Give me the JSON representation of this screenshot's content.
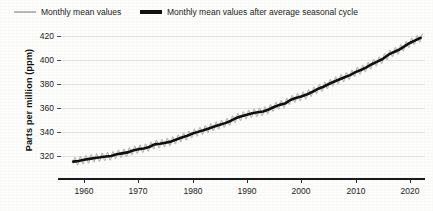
{
  "legend": {
    "items": [
      {
        "label": "Monthly mean values",
        "style": "thin-gray",
        "color": "#b9b9b9"
      },
      {
        "label": "Monthly mean values after average seasonal cycle",
        "style": "thick-black",
        "color": "#111111"
      }
    ]
  },
  "axes": {
    "ylabel": "Parts per million (ppm)",
    "yticks": [
      "320",
      "340",
      "360",
      "380",
      "400",
      "420"
    ],
    "xticks": [
      "1960",
      "1970",
      "1980",
      "1990",
      "2000",
      "2010",
      "2020"
    ]
  },
  "chart_data": {
    "type": "line",
    "title": "",
    "xlabel": "",
    "ylabel": "Parts per million (ppm)",
    "xlim": [
      1957,
      2024
    ],
    "ylim": [
      312,
      424
    ],
    "grid": true,
    "legend_position": "top-left",
    "x": [
      1958,
      1959,
      1960,
      1961,
      1962,
      1963,
      1964,
      1965,
      1966,
      1967,
      1968,
      1969,
      1970,
      1971,
      1972,
      1973,
      1974,
      1975,
      1976,
      1977,
      1978,
      1979,
      1980,
      1981,
      1982,
      1983,
      1984,
      1985,
      1986,
      1987,
      1988,
      1989,
      1990,
      1991,
      1992,
      1993,
      1994,
      1995,
      1996,
      1997,
      1998,
      1999,
      2000,
      2001,
      2002,
      2003,
      2004,
      2005,
      2006,
      2007,
      2008,
      2009,
      2010,
      2011,
      2012,
      2013,
      2014,
      2015,
      2016,
      2017,
      2018,
      2019,
      2020,
      2021,
      2022
    ],
    "series": [
      {
        "name": "Monthly mean values after average seasonal cycle",
        "color": "#111111",
        "values": [
          315.3,
          315.9,
          316.9,
          317.6,
          318.4,
          318.9,
          319.6,
          320.0,
          321.4,
          322.2,
          323.0,
          324.6,
          325.7,
          326.3,
          327.5,
          329.7,
          330.2,
          331.1,
          332.0,
          333.8,
          335.4,
          336.8,
          338.7,
          340.1,
          341.4,
          343.0,
          344.6,
          346.0,
          347.4,
          349.2,
          351.6,
          353.1,
          354.4,
          355.6,
          356.4,
          357.1,
          358.8,
          360.8,
          362.6,
          363.7,
          366.7,
          368.4,
          369.6,
          371.2,
          373.3,
          375.8,
          377.5,
          379.8,
          381.9,
          383.8,
          385.6,
          387.4,
          389.9,
          391.7,
          393.9,
          396.5,
          398.6,
          400.8,
          404.2,
          406.5,
          408.5,
          411.4,
          414.2,
          416.4,
          418.5
        ]
      },
      {
        "name": "Monthly mean values",
        "color": "#b9b9b9",
        "seasonal_amplitude_ppm": 3.2,
        "note": "monthly values oscillate about the smoothed curve with an annual seasonal cycle"
      }
    ]
  }
}
